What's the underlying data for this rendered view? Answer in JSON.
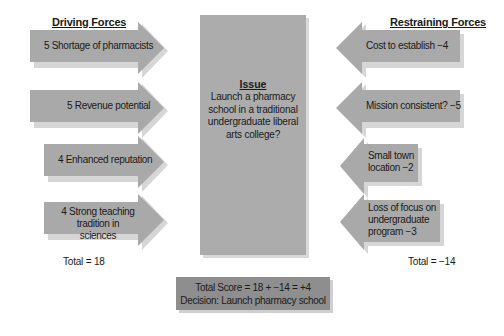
{
  "diagram": {
    "type": "force-field-analysis",
    "driving": {
      "heading": "Driving Forces",
      "forces": [
        {
          "label": "5 Shortage of pharmacists",
          "score": 5
        },
        {
          "label": "5 Revenue potential",
          "score": 5
        },
        {
          "label": "4 Enhanced reputation",
          "score": 4
        },
        {
          "label_line1": "4 Strong teaching",
          "label_line2": "tradition in sciences",
          "score": 4
        }
      ],
      "total_label": "Total = 18"
    },
    "restraining": {
      "heading": "Restraining Forces",
      "forces": [
        {
          "label": "Cost to establish −4",
          "score": -4
        },
        {
          "label": "Mission consistent? −5",
          "score": -5
        },
        {
          "label_line1": "Small town",
          "label_line2": "location −2",
          "score": -2
        },
        {
          "label_line1": "Loss of focus on",
          "label_line2": "undergraduate",
          "label_line3": "program −3",
          "score": -3
        }
      ],
      "total_label": "Total = −14"
    },
    "issue": {
      "title": "Issue",
      "text": "Launch a pharmacy school in a traditional undergraduate liberal arts college?"
    },
    "result": {
      "score_line": "Total Score = 18 + −14 = +4",
      "decision_line": "Decision: Launch pharmacy school"
    },
    "colors": {
      "arrow_fill": "#a9a9a9",
      "arrow_shadow": "#d4d4d4",
      "issue_box": "#acacac",
      "score_box": "#8e8e8e"
    }
  }
}
